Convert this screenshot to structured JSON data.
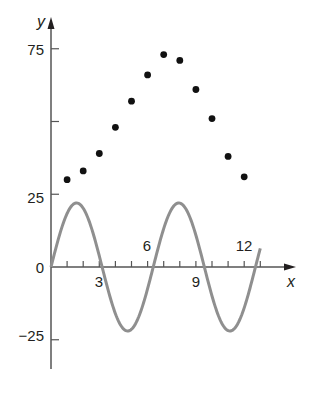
{
  "chart_data": {
    "type": "scatter",
    "title": "",
    "xlabel": "x",
    "ylabel": "y",
    "xlim": [
      0,
      15
    ],
    "ylim": [
      -35,
      85
    ],
    "grid": false,
    "legend": null,
    "x_tick_labels": [
      "3",
      "6",
      "9",
      "12"
    ],
    "x_ticks": [
      1,
      2,
      3,
      4,
      5,
      6,
      7,
      8,
      9,
      10,
      11,
      12,
      13
    ],
    "y_tick_labels": [
      "-25",
      "0",
      "25",
      "75"
    ],
    "y_ticks": [
      -25,
      0,
      25,
      50,
      75
    ],
    "series": [
      {
        "name": "data points",
        "kind": "scatter",
        "color": "#111111",
        "x": [
          1,
          2,
          3,
          4,
          5,
          6,
          7,
          8,
          9,
          10,
          11,
          12
        ],
        "y": [
          30,
          33,
          39,
          48,
          57,
          66,
          73,
          71,
          61,
          51,
          38,
          31
        ]
      },
      {
        "name": "sinusoid",
        "kind": "line",
        "color": "#8a8a8a",
        "function": "y = 22 sin(2*pi*x / 6.35)",
        "amplitude": 22,
        "period": 6.35,
        "x_range": [
          0,
          13
        ]
      }
    ]
  },
  "labels": {
    "x_axis": "x",
    "y_axis": "y",
    "tick_3": "3",
    "tick_6": "6",
    "tick_9": "9",
    "tick_12": "12",
    "tick_y0": "0",
    "tick_y25": "25",
    "tick_y75": "75",
    "tick_yneg25": "−25"
  }
}
